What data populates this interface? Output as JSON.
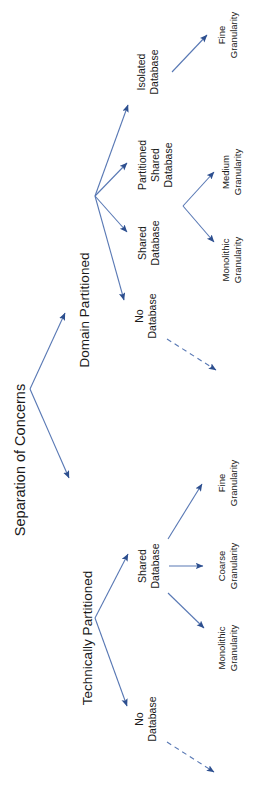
{
  "diagram": {
    "title": "Separation of Concerns",
    "orientation": "rotated-90-ccw",
    "root": {
      "id": "root",
      "label": "Separation of Concerns"
    },
    "nodes": [
      {
        "id": "domain-partitioned",
        "label": "Domain Partitioned",
        "level": 1
      },
      {
        "id": "technically-partitioned",
        "label": "Technically Partitioned",
        "level": 1
      },
      {
        "id": "dp-isolated-database",
        "label": "Isolated\nDatabase",
        "line1": "Isolated",
        "line2": "Database",
        "level": 2
      },
      {
        "id": "dp-partitioned-shared-database",
        "label": "Partitioned\nShared\nDatabase",
        "line1": "Partitioned",
        "line2": "Shared",
        "line3": "Database",
        "level": 2
      },
      {
        "id": "dp-shared-database",
        "label": "Shared\nDatabase",
        "line1": "Shared",
        "line2": "Database",
        "level": 2
      },
      {
        "id": "dp-no-database",
        "label": "No\nDatabase",
        "line1": "No",
        "line2": "Database",
        "level": 2
      },
      {
        "id": "tp-shared-database",
        "label": "Shared\nDatabase",
        "line1": "Shared",
        "line2": "Database",
        "level": 2
      },
      {
        "id": "tp-no-database",
        "label": "No\nDatabase",
        "line1": "No",
        "line2": "Database",
        "level": 2
      },
      {
        "id": "dp-fine-granularity",
        "label": "Fine\nGranularity",
        "line1": "Fine",
        "line2": "Granularity",
        "level": 3
      },
      {
        "id": "dp-medium-granularity",
        "label": "Medium\nGranularity",
        "line1": "Medium",
        "line2": "Granularity",
        "level": 3
      },
      {
        "id": "dp-monolithic-granularity",
        "label": "Monolithic\nGranularity",
        "line1": "Monolithic",
        "line2": "Granularity",
        "level": 3
      },
      {
        "id": "tp-fine-granularity",
        "label": "Fine\nGranularity",
        "line1": "Fine",
        "line2": "Granularity",
        "level": 3
      },
      {
        "id": "tp-coarse-granularity",
        "label": "Coarse\nGranularity",
        "line1": "Coarse",
        "line2": "Granularity",
        "level": 3
      },
      {
        "id": "tp-monolithic-granularity",
        "label": "Monolithic\nGranularity",
        "line1": "Monolithic",
        "line2": "Granularity",
        "level": 3
      }
    ],
    "edges": [
      {
        "from": "root",
        "to": "domain-partitioned",
        "style": "solid"
      },
      {
        "from": "root",
        "to": "technically-partitioned",
        "style": "solid"
      },
      {
        "from": "domain-partitioned",
        "to": "dp-isolated-database",
        "style": "solid"
      },
      {
        "from": "domain-partitioned",
        "to": "dp-partitioned-shared-database",
        "style": "solid"
      },
      {
        "from": "domain-partitioned",
        "to": "dp-shared-database",
        "style": "solid"
      },
      {
        "from": "domain-partitioned",
        "to": "dp-no-database",
        "style": "solid"
      },
      {
        "from": "dp-isolated-database",
        "to": "dp-fine-granularity",
        "style": "solid"
      },
      {
        "from": "dp-shared-databases",
        "to": "dp-medium-granularity",
        "style": "solid"
      },
      {
        "from": "dp-shared-databases",
        "to": "dp-monolithic-granularity",
        "style": "solid"
      },
      {
        "from": "dp-no-database",
        "to": "dp-unlabeled-target",
        "style": "dashed"
      },
      {
        "from": "technically-partitioned",
        "to": "tp-shared-database",
        "style": "solid"
      },
      {
        "from": "technically-partitioned",
        "to": "tp-no-database",
        "style": "solid"
      },
      {
        "from": "tp-shared-database",
        "to": "tp-fine-granularity",
        "style": "solid"
      },
      {
        "from": "tp-shared-database",
        "to": "tp-coarse-granularity",
        "style": "solid"
      },
      {
        "from": "tp-shared-database",
        "to": "tp-monolithic-granularity",
        "style": "solid"
      },
      {
        "from": "tp-no-database",
        "to": "tp-unlabeled-target",
        "style": "dashed"
      }
    ],
    "colors": {
      "line": "#5878b4",
      "arrowhead": "#2d4f8f",
      "text": "#1a1a1a",
      "background": "#ffffff"
    }
  }
}
